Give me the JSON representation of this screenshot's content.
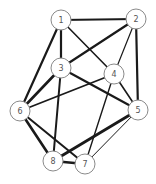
{
  "diagram": {
    "type": "undirected-graph",
    "node_radius": 10,
    "colors": {
      "edge": "#1a1a1a",
      "node_fill": "#ffffff",
      "node_stroke": "#8a8a8a",
      "label": "#555555"
    },
    "nodes": [
      {
        "id": "1",
        "label": "1",
        "x": 61,
        "y": 20
      },
      {
        "id": "2",
        "label": "2",
        "x": 136,
        "y": 19
      },
      {
        "id": "3",
        "label": "3",
        "x": 61,
        "y": 68
      },
      {
        "id": "4",
        "label": "4",
        "x": 114,
        "y": 74
      },
      {
        "id": "5",
        "label": "5",
        "x": 138,
        "y": 110
      },
      {
        "id": "6",
        "label": "6",
        "x": 20,
        "y": 111
      },
      {
        "id": "7",
        "label": "7",
        "x": 85,
        "y": 164
      },
      {
        "id": "8",
        "label": "8",
        "x": 53,
        "y": 161
      }
    ],
    "edges": [
      {
        "from": "1",
        "to": "2",
        "width": 2.2
      },
      {
        "from": "1",
        "to": "3",
        "width": 2.2
      },
      {
        "from": "1",
        "to": "4",
        "width": 1.6
      },
      {
        "from": "1",
        "to": "6",
        "width": 2.2
      },
      {
        "from": "2",
        "to": "3",
        "width": 2.2
      },
      {
        "from": "2",
        "to": "4",
        "width": 1.2
      },
      {
        "from": "2",
        "to": "5",
        "width": 2.2
      },
      {
        "from": "3",
        "to": "5",
        "width": 2.2
      },
      {
        "from": "3",
        "to": "6",
        "width": 2.6
      },
      {
        "from": "3",
        "to": "8",
        "width": 2.0
      },
      {
        "from": "4",
        "to": "5",
        "width": 1.6
      },
      {
        "from": "4",
        "to": "6",
        "width": 1.8
      },
      {
        "from": "4",
        "to": "7",
        "width": 1.4
      },
      {
        "from": "5",
        "to": "7",
        "width": 1.0
      },
      {
        "from": "5",
        "to": "8",
        "width": 2.8
      },
      {
        "from": "6",
        "to": "7",
        "width": 2.0
      },
      {
        "from": "6",
        "to": "8",
        "width": 2.6
      },
      {
        "from": "8",
        "to": "7",
        "width": 2.4
      }
    ]
  }
}
